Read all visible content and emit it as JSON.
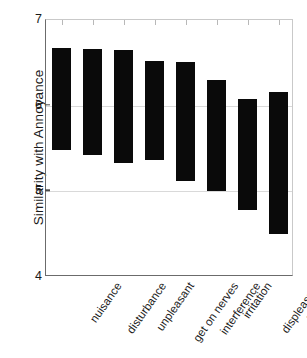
{
  "chart_data": {
    "type": "bar",
    "bar_style": "floating-range",
    "title": "",
    "xlabel": "",
    "ylabel": "Similarity with Annoyance",
    "ylim": [
      4,
      7
    ],
    "yticks": [
      4,
      5,
      6,
      7
    ],
    "ytick_labels": [
      "4",
      "5",
      "6",
      "7"
    ],
    "grid": true,
    "grid_axis": "y",
    "legend": "none",
    "bar_color": "#0a0a0a",
    "categories": [
      "nuisance",
      "disturbance",
      "unpleasant",
      "get on nerves",
      "interference",
      "irritation",
      "displeasure",
      "vexation"
    ],
    "series": [
      {
        "name": "upper bound",
        "values": [
          6.67,
          6.66,
          6.65,
          6.52,
          6.51,
          6.3,
          6.08,
          6.16
        ]
      },
      {
        "name": "lower bound",
        "values": [
          5.48,
          5.42,
          5.33,
          5.36,
          5.12,
          5.0,
          4.78,
          4.5
        ]
      }
    ],
    "bars": [
      {
        "category": "nuisance",
        "high": 6.67,
        "low": 5.48
      },
      {
        "category": "disturbance",
        "high": 6.66,
        "low": 5.42
      },
      {
        "category": "unpleasant",
        "high": 6.65,
        "low": 5.33
      },
      {
        "category": "get on nerves",
        "high": 6.52,
        "low": 5.36
      },
      {
        "category": "interference",
        "high": 6.51,
        "low": 5.12
      },
      {
        "category": "irritation",
        "high": 6.3,
        "low": 5.0
      },
      {
        "category": "displeasure",
        "high": 6.08,
        "low": 4.78
      },
      {
        "category": "vexation",
        "high": 6.16,
        "low": 4.5
      }
    ]
  },
  "axis": {
    "y_title": "Similarity with Annoyance"
  }
}
